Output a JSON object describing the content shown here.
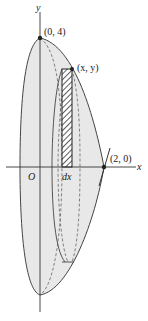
{
  "figure": {
    "type": "solid-of-revolution-shell-method",
    "axes": {
      "x_label": "x",
      "y_label": "y",
      "origin_label": "O"
    },
    "points": [
      {
        "label": "(0, 4)",
        "coords": [
          0,
          4
        ]
      },
      {
        "label": "(x, y)",
        "coords": [
          "x",
          "y"
        ]
      },
      {
        "label": "(2, 0)",
        "coords": [
          2,
          0
        ]
      }
    ],
    "strip_label": "dx",
    "colors": {
      "solid_fill": "#e6e6e6",
      "outline": "#444444",
      "dashed": "#666666",
      "axis": "#333333"
    }
  }
}
